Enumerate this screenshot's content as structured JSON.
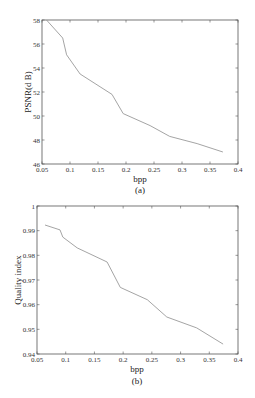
{
  "chart_data": [
    {
      "type": "line",
      "caption": "(a)",
      "title": "",
      "xlabel": "bpp",
      "ylabel": "PSNR(d B)",
      "xlim": [
        0.05,
        0.4
      ],
      "ylim": [
        46,
        58
      ],
      "xticks": [
        0.05,
        0.1,
        0.15,
        0.2,
        0.25,
        0.3,
        0.35,
        0.4
      ],
      "xtick_labels": [
        "0.05",
        "0.1",
        "0.15",
        "0.2",
        "0.25",
        "0.3",
        "0.35",
        "0.4"
      ],
      "yticks": [
        46,
        48,
        50,
        52,
        54,
        56,
        58
      ],
      "ytick_labels": [
        "46",
        "48",
        "50",
        "52",
        "54",
        "56",
        "58"
      ],
      "grid": false,
      "series": [
        {
          "name": "PSNR",
          "x": [
            0.058,
            0.087,
            0.094,
            0.118,
            0.175,
            0.195,
            0.243,
            0.278,
            0.327,
            0.373
          ],
          "y": [
            58.0,
            56.5,
            55.1,
            53.5,
            51.8,
            50.2,
            49.2,
            48.3,
            47.7,
            47.0
          ]
        }
      ]
    },
    {
      "type": "line",
      "caption": "(b)",
      "title": "",
      "xlabel": "bpp",
      "ylabel": "Quality index",
      "xlim": [
        0.05,
        0.4
      ],
      "ylim": [
        0.94,
        1.0
      ],
      "xticks": [
        0.05,
        0.1,
        0.15,
        0.2,
        0.25,
        0.3,
        0.35,
        0.4
      ],
      "xtick_labels": [
        "0.05",
        "0.1",
        "0.15",
        "0.2",
        "0.25",
        "0.3",
        "0.35",
        "0.4"
      ],
      "yticks": [
        0.94,
        0.95,
        0.96,
        0.97,
        0.98,
        0.99,
        1.0
      ],
      "ytick_labels": [
        "0.94",
        "0.95",
        "0.96",
        "0.97",
        "0.98",
        "0.99",
        "1"
      ],
      "grid": false,
      "series": [
        {
          "name": "Quality index",
          "x": [
            0.064,
            0.09,
            0.095,
            0.12,
            0.172,
            0.195,
            0.242,
            0.276,
            0.328,
            0.374
          ],
          "y": [
            0.9923,
            0.9903,
            0.9874,
            0.983,
            0.9773,
            0.967,
            0.962,
            0.955,
            0.9506,
            0.944
          ]
        }
      ]
    }
  ]
}
